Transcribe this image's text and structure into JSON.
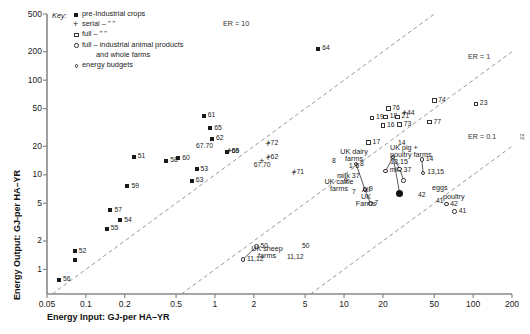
{
  "axes": {
    "x_title": "Energy Input: GJ-per HA–YR",
    "y_title": "Energy Output: GJ-per HA–YR",
    "x_ticks": [
      "0.05",
      "0.1",
      "0.2",
      "0.5",
      "1",
      "2",
      "5",
      "10",
      "20",
      "50",
      "100",
      "200"
    ],
    "y_ticks": [
      "500",
      "200",
      "100",
      "50",
      "20",
      "10",
      "5",
      "2",
      "1"
    ]
  },
  "legend": {
    "title": "Key:",
    "items": [
      {
        "marker": "filled-square",
        "text": "pre-Industrial crops"
      },
      {
        "marker": "plus",
        "text": "serial –      \"            \""
      },
      {
        "marker": "open-square",
        "text": "full –        \"            \""
      },
      {
        "marker": "open-circle",
        "text": "full – industrial animal products"
      },
      {
        "marker": "none",
        "text": "and whole farms"
      },
      {
        "marker": "small-circle",
        "text": "energy budgets"
      }
    ]
  },
  "er_lines": [
    {
      "label": "ER = 10",
      "ratio": 10
    },
    {
      "label": "ER = 1",
      "ratio": 1
    },
    {
      "label": "ER = 0.1",
      "ratio": 0.1
    }
  ],
  "side_number": "22",
  "chart_data": {
    "type": "scatter",
    "title": "",
    "xlabel": "Energy Input: GJ-per HA–YR",
    "ylabel": "Energy Output: GJ-per HA–YR",
    "xscale": "log",
    "yscale": "log",
    "xlim": [
      0.05,
      200
    ],
    "ylim": [
      0.55,
      500
    ],
    "grid": false,
    "legend_position": "top-left",
    "series": [
      {
        "name": "pre-Industrial crops",
        "marker": "filled-square",
        "points": [
          {
            "label": "56",
            "x": 0.062,
            "y": 0.78
          },
          {
            "label": "52",
            "x": 0.082,
            "y": 1.55
          },
          {
            "label": "",
            "x": 0.082,
            "y": 1.25
          },
          {
            "label": "55",
            "x": 0.145,
            "y": 2.7
          },
          {
            "label": "54",
            "x": 0.185,
            "y": 3.3
          },
          {
            "label": "57",
            "x": 0.155,
            "y": 4.2
          },
          {
            "label": "59",
            "x": 0.21,
            "y": 7.6
          },
          {
            "label": "51",
            "x": 0.235,
            "y": 15.5
          },
          {
            "label": "58",
            "x": 0.42,
            "y": 14.0
          },
          {
            "label": "60",
            "x": 0.52,
            "y": 15.0
          },
          {
            "label": "53",
            "x": 0.72,
            "y": 11.5
          },
          {
            "label": "63",
            "x": 0.66,
            "y": 8.6
          },
          {
            "label": "61",
            "x": 0.82,
            "y": 42
          },
          {
            "label": "65",
            "x": 0.92,
            "y": 31
          },
          {
            "label": "62",
            "x": 0.95,
            "y": 24
          },
          {
            "label": "66",
            "x": 1.25,
            "y": 17.5
          },
          {
            "label": "64",
            "x": 6.3,
            "y": 215
          }
        ]
      },
      {
        "name": "serial crops",
        "marker": "plus",
        "points": [
          {
            "label": "+69",
            "x": 1.45,
            "y": 17.5
          },
          {
            "label": "+72",
            "x": 2.9,
            "y": 21
          },
          {
            "label": "+62",
            "x": 2.9,
            "y": 15.0
          },
          {
            "label": "67.70",
            "x": 2.3,
            "y": 12.4
          },
          {
            "label": "+71",
            "x": 4.6,
            "y": 10.4
          },
          {
            "label": "+44",
            "x": 33,
            "y": 44
          }
        ]
      },
      {
        "name": "full industrial crops",
        "marker": "open-square",
        "points": [
          {
            "label": "17",
            "x": 15.5,
            "y": 22
          },
          {
            "label": "19",
            "x": 16.5,
            "y": 40
          },
          {
            "label": "16",
            "x": 20,
            "y": 33
          },
          {
            "label": "18",
            "x": 21,
            "y": 41
          },
          {
            "label": "76",
            "x": 22,
            "y": 50
          },
          {
            "label": "21",
            "x": 26,
            "y": 41
          },
          {
            "label": "73",
            "x": 27,
            "y": 34
          },
          {
            "label": "74",
            "x": 50,
            "y": 61
          },
          {
            "label": "77",
            "x": 46,
            "y": 36
          },
          {
            "label": "23",
            "x": 105,
            "y": 56
          }
        ]
      },
      {
        "name": "full industrial animal products and whole farms",
        "marker": "open-circle",
        "points": [
          {
            "label": "50",
            "x": 2.1,
            "y": 1.75
          },
          {
            "label": "11,12",
            "x": 1.65,
            "y": 1.28
          },
          {
            "label": "8",
            "x": 12.4,
            "y": 13.0
          },
          {
            "label": "9",
            "x": 14.5,
            "y": 7.0
          },
          {
            "label": "7",
            "x": 16.0,
            "y": 5.0
          },
          {
            "label": "milk 37",
            "x": 21,
            "y": 11.0
          },
          {
            "label": "",
            "x": 24,
            "y": 15.5
          },
          {
            "label": "",
            "x": 27,
            "y": 11.5
          },
          {
            "label": "",
            "x": 29,
            "y": 8.7
          },
          {
            "label": "14",
            "x": 40,
            "y": 14.5
          },
          {
            "label": "13,15",
            "x": 41,
            "y": 10.5
          },
          {
            "label": "42",
            "x": 62,
            "y": 4.9
          },
          {
            "label": "41",
            "x": 72,
            "y": 4.1
          }
        ]
      },
      {
        "name": "All UK Farms (energy budget)",
        "marker": "filled-circle",
        "points": [
          {
            "label": "All UK Farms",
            "x": 27,
            "y": 6.3
          }
        ]
      }
    ],
    "annotations": [
      {
        "text": "UK cattle farms",
        "x": 13,
        "y": 4.6
      },
      {
        "text": "UK sheep farms",
        "x": 1.15,
        "y": 1.6
      },
      {
        "text": "UK dairy farms 1-6",
        "x": 20,
        "y": 13.5
      },
      {
        "text": "UK pig + poultry farms",
        "x": 44,
        "y": 13.0
      },
      {
        "text": "eggs",
        "x": 65,
        "y": 5.4
      },
      {
        "text": "poultry",
        "x": 76,
        "y": 4.4
      },
      {
        "text": "ER = 10",
        "x": 28,
        "y": 330
      },
      {
        "text": "ER = 1",
        "x": 150,
        "y": 115
      },
      {
        "text": "ER = 0.1",
        "x": 150,
        "y": 14
      }
    ]
  }
}
